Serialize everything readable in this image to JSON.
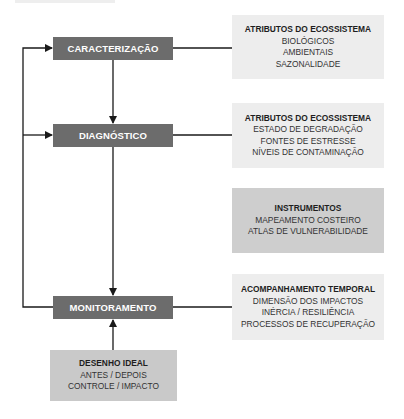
{
  "stages": [
    {
      "label": "CARACTERIZAÇÃO"
    },
    {
      "label": "DIAGNÓSTICO"
    },
    {
      "label": "MONITORAMENTO"
    }
  ],
  "info_boxes": [
    {
      "title": "ATRIBUTOS DO ECOSSISTEMA",
      "lines": [
        "BIOLÓGICOS",
        "AMBIENTAIS",
        "SAZONALIDADE"
      ]
    },
    {
      "title": "ATRIBUTOS DO ECOSSISTEMA",
      "lines": [
        "ESTADO DE DEGRADAÇÃO",
        "FONTES DE ESTRESSE",
        "NÍVEIS DE CONTAMINAÇÃO"
      ]
    },
    {
      "title": "INSTRUMENTOS",
      "lines": [
        "MAPEAMENTO COSTEIRO",
        "ATLAS DE VULNERABILIDADE"
      ]
    },
    {
      "title": "ACOMPANHAMENTO TEMPORAL",
      "lines": [
        "DIMENSÃO DOS IMPACTOS",
        "INÉRCIA / RESILIÊNCIA",
        "PROCESSOS DE RECUPERAÇÃO"
      ]
    }
  ],
  "design_box": {
    "title": "DESENHO IDEAL",
    "lines": [
      "ANTES / DEPOIS",
      "CONTROLE / IMPACTO"
    ]
  },
  "colors": {
    "stage": "#6c6c6c",
    "info_light": "#ededed",
    "info_mid": "#cecece",
    "design": "#c9c9c9",
    "line": "#1a1a1a"
  }
}
